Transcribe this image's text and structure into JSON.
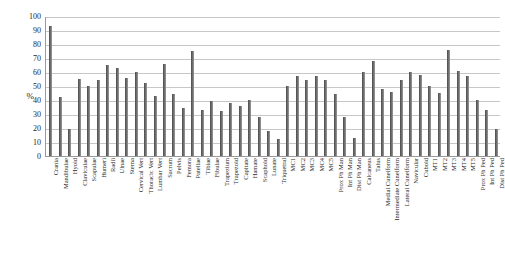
{
  "chart_data": {
    "type": "bar",
    "title": "",
    "subtitle": "",
    "xlabel": "",
    "ylabel": "%",
    "ylim": [
      0,
      100
    ],
    "ytick_step": 10,
    "yticks": [
      0,
      10,
      20,
      30,
      40,
      50,
      60,
      70,
      80,
      90,
      100
    ],
    "ytick_labels": [
      "0",
      "10",
      "20",
      "30",
      "40",
      "50",
      "60",
      "70",
      "80",
      "90",
      "100"
    ],
    "grid": true,
    "grid_axis": "y",
    "legend": false,
    "legend_position": "none",
    "bar_color": "#6d6d6d",
    "categories": [
      "Crania",
      "Mandibulae",
      "Hyoid",
      "Claviculae",
      "Scapulae",
      "Humeri",
      "Radii",
      "Ulnae",
      "Sterna",
      "Cervical Vert",
      "Thoracic Vert",
      "Lumbar Vert",
      "Sacrum",
      "Pelvis",
      "Femora",
      "Patellae",
      "Tibiae",
      "Fibulae",
      "Trapezium",
      "Trapezoid",
      "Capitate",
      "Hamate",
      "Scaphoid",
      "Lunate",
      "Triquetral",
      "MC1",
      "MC2",
      "MC3",
      "MC4",
      "MC5",
      "Prox Ph Man",
      "Int Ph Man",
      "Dist Ph Man",
      "Calcaneus",
      "Talus",
      "Medial Cuneiform",
      "Intermediate Cuneiform",
      "Lateral Cuneiform",
      "Navicular",
      "Cuboid",
      "MT1",
      "MT2",
      "MT3",
      "MT4",
      "MT5",
      "Prox Ph Ped",
      "Int Ph Ped",
      "Dist Ph Ped"
    ],
    "values": [
      93,
      42,
      19,
      55,
      50,
      54,
      65,
      63,
      56,
      60,
      52,
      43,
      66,
      44,
      34,
      75,
      33,
      39,
      32,
      38,
      36,
      40,
      28,
      18,
      12,
      50,
      57,
      54,
      57,
      54,
      44,
      28,
      13,
      60,
      68,
      48,
      46,
      54,
      60,
      58,
      50,
      45,
      76,
      61,
      57,
      40,
      33,
      19
    ]
  }
}
